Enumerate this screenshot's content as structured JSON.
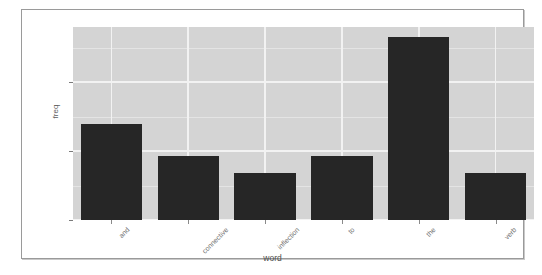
{
  "chart_data": {
    "type": "bar",
    "title": "",
    "xlabel": "word",
    "ylabel": "freq",
    "categories": [
      "and",
      "connective",
      "inflection",
      "to",
      "the",
      "verb"
    ],
    "values": [
      28,
      18.5,
      13.5,
      18.5,
      53,
      13.5
    ],
    "ylim": [
      0,
      56
    ],
    "yticks": [
      0,
      20,
      40
    ],
    "ytick_labels": [
      "0",
      "20",
      "40"
    ],
    "yminor_ticks": [
      10,
      30,
      50
    ],
    "grid": true,
    "legend": "none",
    "bar_color": "#262626",
    "panel_color": "#d4d4d4",
    "gridline_color": "#f2f2f2"
  },
  "figure": {
    "background": "#ffffff",
    "border_color": "#9a9a9a"
  }
}
